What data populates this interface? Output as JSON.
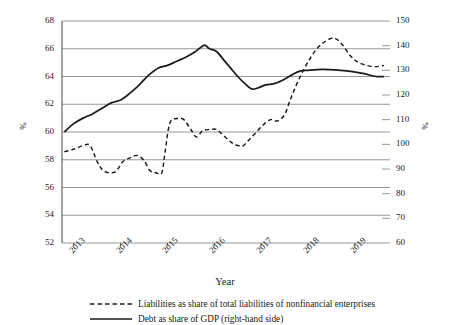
{
  "chart_data": {
    "type": "line",
    "title": "",
    "xlabel": "Year",
    "ylabel": "%",
    "ylabel_right": "%",
    "grid": true,
    "legend_position": "bottom",
    "xlim": [
      2012.75,
      2019.75
    ],
    "ylim": [
      52,
      68
    ],
    "ylim_right": [
      60,
      150
    ],
    "xticks": [
      2013,
      2014,
      2015,
      2016,
      2017,
      2018,
      2019
    ],
    "xtick_labels": [
      "2013",
      "2014",
      "2015",
      "2016",
      "2017",
      "2018",
      "2019"
    ],
    "yticks_left": [
      52,
      54,
      56,
      58,
      60,
      62,
      64,
      66,
      68
    ],
    "ytick_labels_left": [
      "52",
      "54",
      "56",
      "58",
      "60",
      "62",
      "64",
      "66",
      "68"
    ],
    "yticks_right": [
      60,
      70,
      80,
      90,
      100,
      110,
      120,
      130,
      140,
      150
    ],
    "ytick_labels_right": [
      "60",
      "70",
      "80",
      "90",
      "100",
      "110",
      "120",
      "130",
      "140",
      "150"
    ],
    "series": [
      {
        "name": "Liabilities as share of total liabilities of nonfinancial enterprises",
        "axis": "right",
        "style": "dashed",
        "color": "#1a1a1a",
        "x": [
          2012.8,
          2013.0,
          2013.2,
          2013.35,
          2013.5,
          2013.62,
          2013.75,
          2013.9,
          2014.05,
          2014.2,
          2014.35,
          2014.5,
          2014.62,
          2014.75,
          2014.88,
          2014.95,
          2015.05,
          2015.2,
          2015.35,
          2015.5,
          2015.62,
          2015.75,
          2015.9,
          2016.05,
          2016.2,
          2016.35,
          2016.5,
          2016.62,
          2016.75,
          2016.9,
          2017.05,
          2017.2,
          2017.35,
          2017.5,
          2017.62,
          2017.75,
          2017.9,
          2018.05,
          2018.2,
          2018.35,
          2018.5,
          2018.62,
          2018.75,
          2018.9,
          2019.05,
          2019.25,
          2019.45,
          2019.62
        ],
        "y": [
          97.0,
          98.0,
          99.5,
          99.5,
          93.0,
          89.5,
          88.5,
          89.0,
          93.0,
          94.5,
          95.5,
          93.5,
          89.5,
          88.5,
          88.5,
          97.0,
          108.5,
          110.5,
          110.0,
          106.0,
          103.0,
          105.5,
          106.0,
          106.0,
          103.5,
          101.0,
          99.5,
          99.5,
          102.0,
          105.0,
          108.0,
          110.0,
          109.5,
          112.0,
          118.0,
          124.0,
          130.0,
          135.0,
          139.0,
          141.5,
          143.0,
          142.5,
          140.0,
          136.0,
          133.5,
          132.0,
          131.5,
          132.0
        ]
      },
      {
        "name": "Debt as share of GDP (right-hand side)",
        "axis": "left",
        "style": "solid",
        "color": "#1a1a1a",
        "x": [
          2012.8,
          2013.0,
          2013.2,
          2013.4,
          2013.6,
          2013.8,
          2014.0,
          2014.2,
          2014.4,
          2014.6,
          2014.8,
          2015.0,
          2015.2,
          2015.4,
          2015.6,
          2015.78,
          2015.9,
          2016.05,
          2016.2,
          2016.35,
          2016.5,
          2016.65,
          2016.8,
          2016.95,
          2017.1,
          2017.3,
          2017.5,
          2017.7,
          2017.85,
          2018.0,
          2018.2,
          2018.45,
          2018.7,
          2018.95,
          2019.2,
          2019.45,
          2019.62
        ],
        "y": [
          60.0,
          60.6,
          61.0,
          61.3,
          61.7,
          62.1,
          62.3,
          62.8,
          63.4,
          64.1,
          64.6,
          64.8,
          65.1,
          65.4,
          65.8,
          66.25,
          66.0,
          65.8,
          65.2,
          64.6,
          64.0,
          63.5,
          63.1,
          63.2,
          63.4,
          63.5,
          63.8,
          64.2,
          64.4,
          64.45,
          64.5,
          64.5,
          64.45,
          64.35,
          64.2,
          64.0,
          64.0
        ]
      }
    ]
  },
  "legend": {
    "items": [
      {
        "label": "Liabilities as share of total liabilities of nonfinancial enterprises",
        "style": "dashed"
      },
      {
        "label": "Debt as share of GDP (right-hand side)",
        "style": "solid"
      }
    ]
  },
  "axes": {
    "x_title": "Year",
    "y_title_left": "%",
    "y_title_right": "%"
  }
}
